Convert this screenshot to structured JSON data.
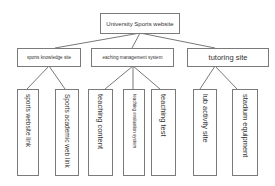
{
  "root": {
    "label": "University Sports website"
  },
  "level1": [
    {
      "label": "sports knowledge site"
    },
    {
      "label": "eaching management system"
    },
    {
      "label": "tutoring site"
    }
  ],
  "level2": [
    {
      "label": "sports website link"
    },
    {
      "label": "Sports academic web link"
    },
    {
      "label": "teaching content"
    },
    {
      "label": "teaching evaluation system"
    },
    {
      "label": "teaching test"
    },
    {
      "label": "lub activity site"
    },
    {
      "label": "stadium equipment"
    }
  ]
}
